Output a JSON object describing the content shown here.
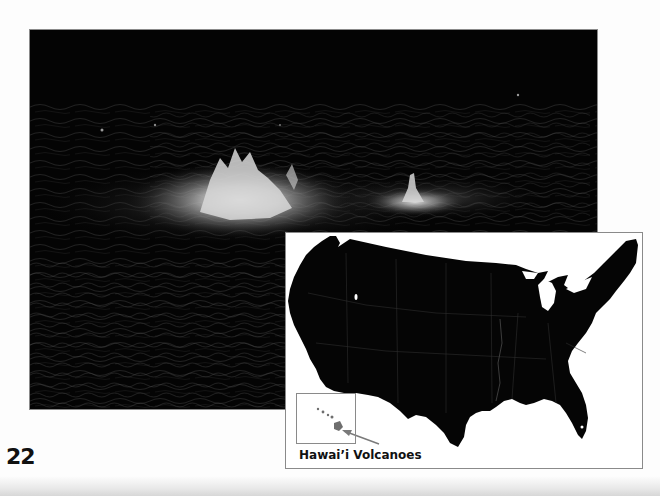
{
  "page": {
    "number": "22",
    "background_color": "#fdfdfd"
  },
  "photo": {
    "subject": "lava-fountains-at-night",
    "border_color": "#8a8a8a",
    "background_color": "#050505"
  },
  "map": {
    "subject": "contiguous-united-states",
    "land_color": "#050505",
    "border_color": "#8a8a8a",
    "inset": {
      "subject": "hawaiian-islands"
    },
    "label": "Hawai’i Volcanoes",
    "arrow_color": "#7a7a7a"
  }
}
